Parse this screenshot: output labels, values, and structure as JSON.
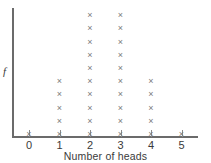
{
  "chart_data": {
    "type": "scatter",
    "plot_style": "dot-plot",
    "title": "",
    "xlabel": "Number of heads",
    "ylabel": "f",
    "categories": [
      0,
      1,
      2,
      3,
      4,
      5
    ],
    "xtick_labels": [
      "0",
      "1",
      "2",
      "3",
      "4",
      "5"
    ],
    "values": [
      1,
      5,
      10,
      10,
      5,
      1
    ],
    "series": [
      {
        "name": "frequency",
        "values": [
          1,
          5,
          10,
          10,
          5,
          1
        ]
      }
    ],
    "marker": "x",
    "marker_glyph": "×",
    "marker_color": "#7a7a7a",
    "axis_color": "#6b6b6b",
    "grid": false,
    "legend": false,
    "xlim": [
      -0.5,
      5.8
    ],
    "ylim": [
      0,
      11
    ],
    "ytick_labels": [],
    "annotations": []
  },
  "axes": {
    "y_label": "f",
    "x_title": "Number of heads"
  }
}
